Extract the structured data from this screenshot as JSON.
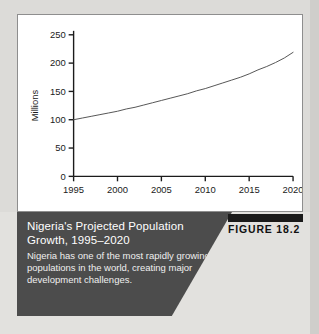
{
  "figure": {
    "badge_label": "FIGURE 18.2",
    "caption_title": "Nigeria's Projected Population Growth, 1995–2020",
    "caption_body": "Nigeria has one of the most rapidly growing populations in the world, creating major development challenges."
  },
  "chart_data": {
    "type": "line",
    "title": "",
    "xlabel": "",
    "ylabel": "Millions",
    "xlim": [
      1995,
      2020
    ],
    "ylim": [
      0,
      250
    ],
    "grid": false,
    "legend": false,
    "xticks": [
      1995,
      2000,
      2005,
      2010,
      2015,
      2020
    ],
    "xtick_labels": [
      "1995",
      "2000",
      "2005",
      "2010",
      "2015",
      "2020"
    ],
    "yticks": [
      0,
      50,
      100,
      150,
      200,
      250
    ],
    "ytick_labels": [
      "0",
      "50",
      "100",
      "150",
      "200",
      "250"
    ],
    "x": [
      1995,
      1996,
      1997,
      1998,
      1999,
      2000,
      2001,
      2002,
      2003,
      2004,
      2005,
      2006,
      2007,
      2008,
      2009,
      2010,
      2011,
      2012,
      2013,
      2014,
      2015,
      2016,
      2017,
      2018,
      2019,
      2020
    ],
    "values": [
      100,
      103,
      106,
      109,
      112,
      115,
      119,
      122,
      126,
      130,
      134,
      138,
      142,
      146,
      151,
      155,
      160,
      165,
      170,
      175,
      181,
      188,
      194,
      201,
      209,
      219
    ],
    "series": [
      {
        "name": "Projected population",
        "values": [
          100,
          103,
          106,
          109,
          112,
          115,
          119,
          122,
          126,
          130,
          134,
          138,
          142,
          146,
          151,
          155,
          160,
          165,
          170,
          175,
          181,
          188,
          194,
          201,
          209,
          219
        ]
      }
    ],
    "line_color": "#555555",
    "axis_color": "#1b1b1b",
    "panel_background": "#ffffff"
  },
  "colors": {
    "caption_background": "#4c4c4c",
    "caption_text": "#ffffff",
    "badge_bar": "#1a1a1a",
    "page_background": "#dcdbd8"
  }
}
